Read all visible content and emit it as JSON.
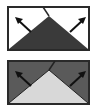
{
  "diagrams": [
    {
      "name": "light-background-dark-triangle",
      "background": "#ffffff",
      "triangle": "#3a3a3a",
      "border": "#2a2a2a",
      "arrows": [
        "up-left",
        "up-right"
      ]
    },
    {
      "name": "dark-background-light-triangle",
      "background": "#5a5a5a",
      "triangle": "#d8d8d8",
      "border": "#2a2a2a",
      "arrows": [
        "up-left",
        "up-right"
      ]
    }
  ]
}
